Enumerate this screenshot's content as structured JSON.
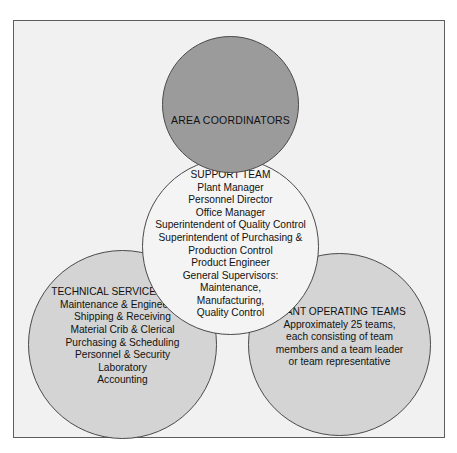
{
  "diagram": {
    "type": "venn-overlapping-circles-org-chart",
    "frame": {
      "border_color": "#5d5d5d",
      "background_color": "#f1f1f1"
    },
    "colors": {
      "area_coordinators_fill": "#9b9b9b",
      "support_team_fill": "#f4f4f4",
      "team_circle_fill": "#d4d4d4",
      "outline": "#4a4a4a",
      "text": "#111111"
    },
    "circles": [
      {
        "id": "area-coordinators",
        "heading": "AREA COORDINATORS",
        "items": [],
        "text": "AREA COORDINATORS"
      },
      {
        "id": "support-team",
        "heading": "SUPPORT TEAM",
        "items": [
          "Plant Manager",
          "Personnel Director",
          "Office Manager",
          "Superintendent of Quality Control",
          "Superintendent of Purchasing &",
          "Production Control",
          "Product Engineer",
          "General Supervisors:",
          "Maintenance,",
          "Manufacturing,",
          "Quality Control"
        ],
        "text": "SUPPORT TEAM\nPlant Manager\nPersonnel Director\nOffice Manager\nSuperintendent of Quality Control\nSuperintendent of Purchasing &\nProduction Control\nProduct Engineer\nGeneral Supervisors:\nMaintenance,\nManufacturing,\nQuality Control"
      },
      {
        "id": "technical-service-teams",
        "heading": "TECHNICAL SERVICE TEAMS",
        "items": [
          "Maintenance & Engineering",
          "Shipping & Receiving",
          "Material Crib & Clerical",
          "Purchasing & Scheduling",
          "Personnel & Security",
          "Laboratory",
          "Accounting"
        ],
        "text": "TECHNICAL SERVICE TEAMS\nMaintenance & Engineering\nShipping & Receiving\nMaterial Crib & Clerical\nPurchasing & Scheduling\nPersonnel & Security\nLaboratory\nAccounting"
      },
      {
        "id": "plant-operating-teams",
        "heading": "PLANT OPERATING TEAMS",
        "items": [
          "Approximately 25 teams,",
          "each consisting of team",
          "members and a team leader",
          "or team representative"
        ],
        "text": "PLANT OPERATING TEAMS\nApproximately 25 teams,\neach consisting of team\nmembers and a team leader\nor team representative"
      }
    ]
  }
}
